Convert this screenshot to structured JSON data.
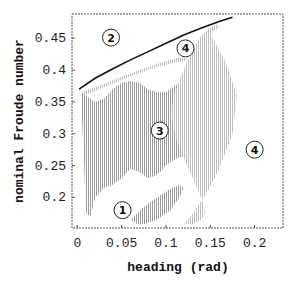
{
  "chart_data": {
    "type": "scatter",
    "title": "",
    "xlabel": "heading (rad)",
    "ylabel": "nominal Froude number",
    "xlim": [
      -0.006,
      0.232
    ],
    "ylim": [
      0.152,
      0.488
    ],
    "xticks": [
      0,
      0.05,
      0.1,
      0.15,
      0.2
    ],
    "xtick_labels": [
      "0",
      "0.05",
      "0.1",
      "0.15",
      "0.2"
    ],
    "yticks": [
      0.2,
      0.25,
      0.3,
      0.35,
      0.4,
      0.45
    ],
    "ytick_labels": [
      "0.2",
      "0.25",
      "0.3",
      "0.35",
      "0.4",
      "0.45"
    ],
    "grid": false,
    "legend": null,
    "boundary_curve": {
      "name": "upper stability boundary",
      "color": "#111111",
      "x": [
        0.002,
        0.02,
        0.04,
        0.06,
        0.08,
        0.1,
        0.12,
        0.14,
        0.16,
        0.175
      ],
      "y": [
        0.37,
        0.387,
        0.402,
        0.416,
        0.429,
        0.442,
        0.455,
        0.466,
        0.476,
        0.483
      ]
    },
    "shaded_regions": [
      {
        "name": "region-3-main",
        "color": "#a8a8a8",
        "polygon_x": [
          0.004,
          0.01,
          0.02,
          0.03,
          0.04,
          0.05,
          0.06,
          0.07,
          0.08,
          0.09,
          0.1,
          0.11,
          0.12,
          0.13,
          0.135,
          0.13,
          0.12,
          0.11,
          0.1,
          0.09,
          0.08,
          0.07,
          0.06,
          0.05,
          0.04,
          0.03,
          0.02,
          0.015,
          0.01
        ],
        "polygon_y": [
          0.365,
          0.36,
          0.35,
          0.355,
          0.37,
          0.38,
          0.383,
          0.38,
          0.37,
          0.365,
          0.365,
          0.375,
          0.385,
          0.37,
          0.33,
          0.29,
          0.265,
          0.26,
          0.25,
          0.235,
          0.23,
          0.24,
          0.245,
          0.23,
          0.22,
          0.215,
          0.2,
          0.17,
          0.175
        ]
      },
      {
        "name": "region-1-lower-lobe",
        "color": "#a8a8a8",
        "polygon_x": [
          0.06,
          0.075,
          0.09,
          0.105,
          0.115,
          0.12,
          0.115,
          0.105,
          0.09,
          0.075,
          0.068
        ],
        "polygon_y": [
          0.165,
          0.185,
          0.2,
          0.213,
          0.22,
          0.215,
          0.2,
          0.18,
          0.165,
          0.158,
          0.158
        ]
      },
      {
        "name": "outer-band",
        "color": "#b8b8b8",
        "polygon_x": [
          0.12,
          0.13,
          0.145,
          0.16,
          0.175,
          0.18,
          0.168,
          0.156,
          0.15,
          0.152,
          0.158,
          0.16,
          0.158,
          0.15,
          0.14,
          0.13,
          0.12,
          0.11,
          0.105,
          0.112,
          0.124,
          0.135,
          0.142,
          0.144,
          0.14,
          0.13
        ],
        "polygon_y": [
          0.158,
          0.175,
          0.205,
          0.245,
          0.3,
          0.36,
          0.41,
          0.442,
          0.455,
          0.46,
          0.465,
          0.468,
          0.472,
          0.467,
          0.455,
          0.43,
          0.4,
          0.365,
          0.33,
          0.29,
          0.25,
          0.215,
          0.19,
          0.175,
          0.165,
          0.158
        ]
      },
      {
        "name": "region-4-upper-band",
        "color": "#c0c0c0",
        "polygon_x": [
          0.005,
          0.03,
          0.06,
          0.09,
          0.115,
          0.125,
          0.12,
          0.09,
          0.06,
          0.03,
          0.008
        ],
        "polygon_y": [
          0.366,
          0.378,
          0.395,
          0.41,
          0.42,
          0.418,
          0.415,
          0.405,
          0.39,
          0.373,
          0.36
        ]
      }
    ],
    "annotations": [
      {
        "text": "1",
        "x": 0.051,
        "y": 0.18
      },
      {
        "text": "2",
        "x": 0.038,
        "y": 0.451
      },
      {
        "text": "3",
        "x": 0.093,
        "y": 0.305
      },
      {
        "text": "4",
        "x": 0.122,
        "y": 0.434
      },
      {
        "text": "4",
        "x": 0.2,
        "y": 0.275
      }
    ]
  }
}
